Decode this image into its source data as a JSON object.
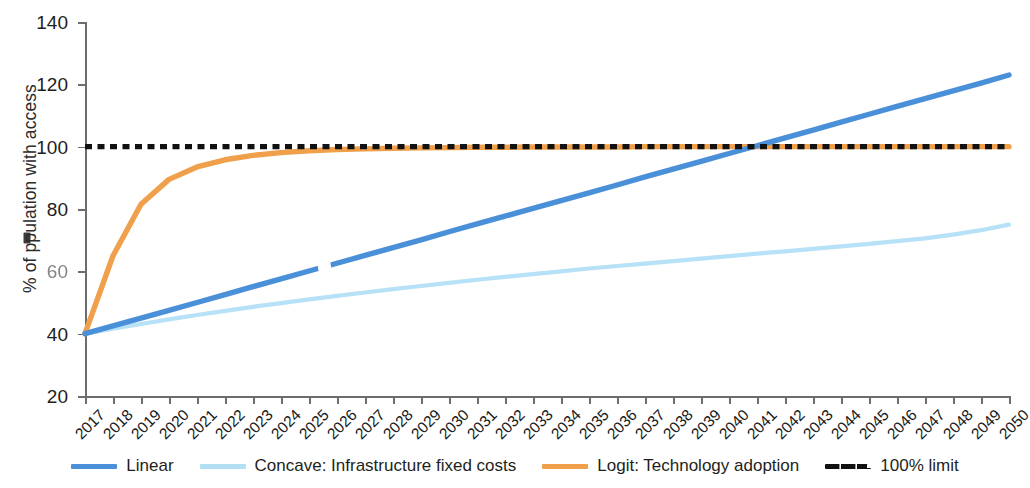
{
  "chart_data": {
    "type": "line",
    "title": "",
    "xlabel": "",
    "ylabel": "% of population with access",
    "ylabel_prefix": "% of p",
    "ylabel_suffix": "pulation with access",
    "grid": false,
    "legend_position": "bottom",
    "xlim": [
      2017,
      2050
    ],
    "ylim": [
      20,
      140
    ],
    "yticks": [
      140,
      120,
      100,
      80,
      60,
      40,
      20
    ],
    "ytick_labels": [
      "140",
      "120",
      "100",
      "80",
      "60",
      "40",
      "20"
    ],
    "degraded_ytick_label": "60",
    "x": [
      2017,
      2018,
      2019,
      2020,
      2021,
      2022,
      2023,
      2024,
      2025,
      2026,
      2027,
      2028,
      2029,
      2030,
      2031,
      2032,
      2033,
      2034,
      2035,
      2036,
      2037,
      2038,
      2039,
      2040,
      2041,
      2042,
      2043,
      2044,
      2045,
      2046,
      2047,
      2048,
      2049,
      2050
    ],
    "categories": [
      "2017",
      "2018",
      "2019",
      "2020",
      "2021",
      "2022",
      "2023",
      "2024",
      "2025",
      "2026",
      "2027",
      "2028",
      "2029",
      "2030",
      "2031",
      "2032",
      "2033",
      "2034",
      "2035",
      "2036",
      "2037",
      "2038",
      "2039",
      "2040",
      "2041",
      "2042",
      "2043",
      "2044",
      "2045",
      "2046",
      "2047",
      "2048",
      "2049",
      "2050"
    ],
    "series": [
      {
        "name": "Linear",
        "color": "#4a90d9",
        "style": "solid",
        "values": [
          40.0,
          42.5,
          45.0,
          47.5,
          50.0,
          52.5,
          55.1,
          57.6,
          60.1,
          62.6,
          65.1,
          67.6,
          70.1,
          72.7,
          75.2,
          77.7,
          80.2,
          82.7,
          85.2,
          87.7,
          90.3,
          92.8,
          95.3,
          97.8,
          100.3,
          102.8,
          105.3,
          107.9,
          110.4,
          112.9,
          115.4,
          117.9,
          120.4,
          123.0
        ]
      },
      {
        "name": "Concave: Infrastructure fixed costs",
        "color": "#b3dff5",
        "style": "solid",
        "values": [
          40.0,
          41.6,
          43.1,
          44.6,
          46.0,
          47.3,
          48.6,
          49.8,
          51.0,
          52.1,
          53.2,
          54.3,
          55.3,
          56.3,
          57.3,
          58.2,
          59.1,
          60.0,
          60.9,
          61.7,
          62.5,
          63.3,
          64.1,
          64.9,
          65.7,
          66.4,
          67.2,
          68.0,
          68.8,
          69.7,
          70.6,
          71.8,
          73.2,
          75.0
        ]
      },
      {
        "name": "Logit: Technology adoption",
        "color": "#f0a04b",
        "style": "solid",
        "values": [
          40.0,
          65.0,
          81.5,
          89.5,
          93.5,
          95.8,
          97.2,
          98.1,
          98.7,
          99.1,
          99.3,
          99.5,
          99.6,
          99.7,
          99.8,
          99.8,
          99.9,
          99.9,
          99.9,
          99.9,
          100.0,
          100.0,
          100.0,
          100.0,
          100.0,
          100.0,
          100.0,
          100.0,
          100.0,
          100.0,
          100.0,
          100.0,
          100.0,
          100.0
        ]
      },
      {
        "name": "100% limit",
        "color": "#111111",
        "style": "dashed",
        "constant": 100,
        "values": [
          100,
          100,
          100,
          100,
          100,
          100,
          100,
          100,
          100,
          100,
          100,
          100,
          100,
          100,
          100,
          100,
          100,
          100,
          100,
          100,
          100,
          100,
          100,
          100,
          100,
          100,
          100,
          100,
          100,
          100,
          100,
          100,
          100,
          100
        ]
      }
    ],
    "annotations": [
      {
        "text": "Linear crosses 100% limit",
        "x": 2041,
        "y": 100
      }
    ]
  },
  "legend": {
    "items": [
      {
        "label": "Linear",
        "color": "#4a90d9",
        "style": "solid"
      },
      {
        "label": "Concave: Infrastructure fixed costs",
        "color": "#b3dff5",
        "style": "solid"
      },
      {
        "label": "Logit: Technology adoption",
        "color": "#f0a04b",
        "style": "solid"
      },
      {
        "label": "100% limit",
        "color": "#111111",
        "style": "dashed"
      }
    ]
  },
  "colors": {
    "linear": "#4a90d9",
    "concave": "#b3dff5",
    "logit": "#f0a04b",
    "limit": "#111111",
    "axis": "#6d6d6d",
    "text": "#231f20",
    "background": "#ffffff"
  }
}
